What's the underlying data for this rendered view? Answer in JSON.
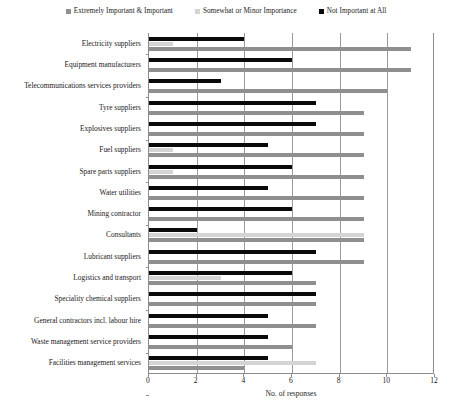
{
  "legend": {
    "position": "top-center",
    "entries": [
      {
        "label": "Extremely Important & Important",
        "color": "#8f8f8f",
        "icon": "square-swatch-icon"
      },
      {
        "label": "Somewhat or Minor Importance",
        "color": "#d4d4d4",
        "icon": "square-swatch-icon"
      },
      {
        "label": "Not Important at All",
        "color": "#0a0a0a",
        "icon": "square-swatch-icon"
      }
    ]
  },
  "axis": {
    "x_title": "No. of responses",
    "x_ticks": [
      "0",
      "2",
      "4",
      "6",
      "8",
      "10",
      "12"
    ],
    "x_min": 0,
    "x_max": 12
  },
  "caption": "",
  "chart_data": {
    "type": "bar",
    "orientation": "horizontal",
    "title": "",
    "xlabel": "No. of responses",
    "ylabel": "",
    "xlim": [
      0,
      12
    ],
    "grid": true,
    "legend_position": "top-center",
    "categories": [
      "Electricity suppliers",
      "Equipment manufacturers",
      "Telecommunications services providers",
      "Tyre suppliers",
      "Explosives suppliers",
      "Fuel suppliers",
      "Spare parts suppliers",
      "Water utilities",
      "Mining contractor",
      "Consultants",
      "Lubricant suppliers",
      "Logistics and transport",
      "Speciality chemical suppliers",
      "General contractors incl. labour hire",
      "Waste management service providers",
      "Facilities management services"
    ],
    "series": [
      {
        "name": "Extremely Important & Important",
        "color": "#8f8f8f",
        "values": [
          11,
          11,
          10,
          9,
          9,
          9,
          9,
          9,
          9,
          9,
          9,
          7,
          7,
          7,
          6,
          4
        ]
      },
      {
        "name": "Somewhat or Minor Importance",
        "color": "#d4d4d4",
        "values": [
          1,
          0,
          0,
          0,
          0,
          1,
          1,
          0,
          0,
          9,
          0,
          3,
          0,
          0,
          0,
          7
        ]
      },
      {
        "name": "Not Important at All",
        "color": "#0a0a0a",
        "values": [
          4,
          6,
          3,
          7,
          7,
          5,
          6,
          5,
          6,
          2,
          7,
          6,
          7,
          5,
          5,
          5
        ]
      }
    ]
  }
}
